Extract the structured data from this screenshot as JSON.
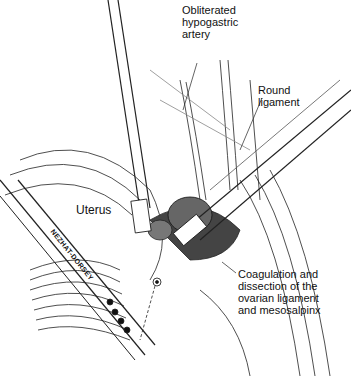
{
  "figure": {
    "type": "surgical illustration",
    "labels": {
      "hypogastric": [
        "Obliterated",
        "hypogastric",
        "artery"
      ],
      "round_ligament": [
        "Round",
        "ligament"
      ],
      "uterus": "Uterus",
      "coagulation": [
        "Coagulation and",
        "dissection of the",
        "ovarian ligament",
        "and mesosalpinx"
      ],
      "instrument": "NEZHAT-DORSEY"
    }
  }
}
